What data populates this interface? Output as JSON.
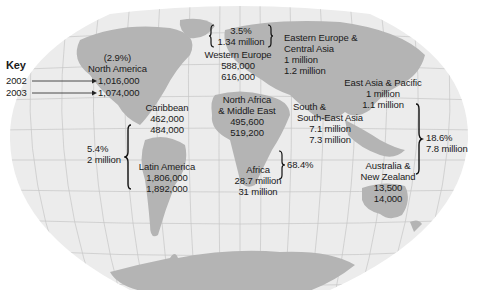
{
  "key": {
    "title": "Key",
    "year_a": "2002",
    "year_b": "2003"
  },
  "regions": {
    "north_america": {
      "share": "(2.9%)",
      "name": "North America",
      "v2002": "1,016,000",
      "v2003": "1,074,000"
    },
    "caribbean": {
      "name": "Caribbean",
      "v2002": "462,000",
      "v2003": "484,000"
    },
    "latin_america": {
      "name": "Latin America",
      "v2002": "1,806,000",
      "v2003": "1,892,000"
    },
    "latam_carib_total": {
      "share": "5.4%",
      "total": "2 million"
    },
    "western_europe": {
      "name": "Western Europe",
      "v2002": "588,000",
      "v2003": "616,000"
    },
    "europe_total": {
      "share": "3.5%",
      "total": "1.34 million"
    },
    "eastern_europe": {
      "name_line1": "Eastern Europe &",
      "name_line2": "Central Asia",
      "v2002": "1 million",
      "v2003": "1.2 million"
    },
    "north_africa": {
      "name_line1": "North Africa",
      "name_line2": "& Middle East",
      "v2002": "495,600",
      "v2003": "519,200"
    },
    "africa": {
      "name": "Africa",
      "v2002": "28.7 million",
      "v2003": "31 million"
    },
    "africa_total": {
      "share": "68.4%"
    },
    "south_asia": {
      "name_line1": "South &",
      "name_line2": "South-East Asia",
      "v2002": "7.1 million",
      "v2003": "7.3 million"
    },
    "east_asia": {
      "name": "East Asia & Pacific",
      "v2002": "1 million",
      "v2003": "1.1 million"
    },
    "asia_total": {
      "share": "18.6%",
      "total": "7.8 million"
    },
    "australia": {
      "name_line1": "Australia &",
      "name_line2": "New Zealand",
      "v2002": "13,500",
      "v2003": "14,000"
    }
  },
  "colors": {
    "ocean": "#ececec",
    "land": "#b4b4b4",
    "grid": "#c8c8c8",
    "text": "#1a1a1a"
  }
}
